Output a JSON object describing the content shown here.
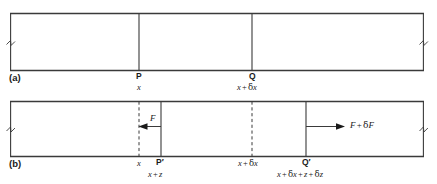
{
  "figure": {
    "type": "physics-diagram",
    "background_color": "#ffffff",
    "line_color": "#3a3a3a"
  },
  "panels": [
    {
      "id": "a",
      "label": "(a)",
      "points": [
        {
          "name": "P",
          "label": "P",
          "coordinate": "x"
        },
        {
          "name": "Q",
          "label": "Q",
          "coordinate_parts": {
            "lead": "x",
            "op": "+",
            "delta": "δ",
            "var": "x"
          }
        }
      ]
    },
    {
      "id": "b",
      "label": "(b)",
      "points": [
        {
          "name": "x",
          "label": "x"
        },
        {
          "name": "P-prime",
          "label": "P′",
          "coordinate_parts": {
            "lead": "x",
            "op": "+",
            "var": "z"
          }
        },
        {
          "name": "x-plus-delta-x",
          "label_parts": {
            "lead": "x",
            "op": "+",
            "delta": "δ",
            "var": "x"
          }
        },
        {
          "name": "Q-prime",
          "label": "Q′",
          "coordinate_parts": {
            "lead": "x",
            "op1": "+",
            "d1": "δ",
            "v1": "x",
            "op2": "+",
            "v2": "z",
            "op3": "+",
            "d2": "δ",
            "v3": "z"
          }
        }
      ],
      "forces": [
        {
          "name": "F",
          "label": "F",
          "direction": "left"
        },
        {
          "name": "F-plus-dF",
          "label_parts": {
            "lead": "F",
            "op": "+",
            "delta": "δ",
            "var": "F"
          },
          "direction": "right"
        }
      ]
    }
  ],
  "text": {
    "panel_a_label": "(a)",
    "panel_b_label": "(b)",
    "point_P": "P",
    "point_Q": "Q",
    "point_P_prime": "P′",
    "point_Q_prime": "Q′",
    "coord_x": "x",
    "coord_x2": "x",
    "force_F": "F"
  }
}
